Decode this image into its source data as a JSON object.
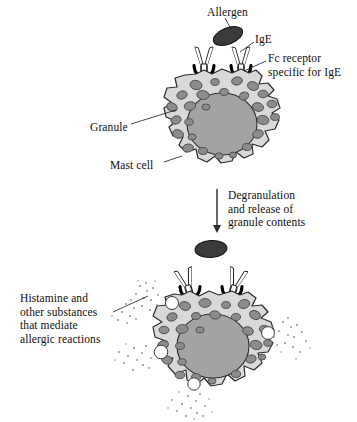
{
  "figure": {
    "background_color": "#ffffff",
    "ink_color": "#100f0f",
    "palette": {
      "cytoplasm": "#d9d9d9",
      "nucleus": "#a3a3a3",
      "granule": "#8c8c8c",
      "granule_outline": "#4a4a4a",
      "allergen": "#3b3b3b",
      "empty_granule": "#ffffff",
      "antibody_fill": "#ffffff",
      "receptor": "#000000",
      "stipple": "#9a9a9a"
    },
    "labels": {
      "allergen": "Allergen",
      "ige": "IgE",
      "fc_receptor": "Fc receptor\nspecific for IgE",
      "granule": "Granule",
      "mast_cell": "Mast cell",
      "degranulation": "Degranulation\nand release of\ngranule contents",
      "histamine": "Histamine and\nother substances\nthat mediate\nallergic reactions"
    },
    "panels": [
      {
        "name": "resting-mast-cell",
        "description": "Mast cell with IgE bound to Fc receptors; allergen approaching",
        "antibody_count": 2,
        "receptor_count": 2,
        "allergen_bound": false
      },
      {
        "name": "degranulating-mast-cell",
        "description": "Allergen cross-links two IgE molecules, triggering degranulation and release of granule contents",
        "antibody_count": 2,
        "receptor_count": 2,
        "allergen_bound": true,
        "released_granules": 4
      }
    ],
    "flow_arrow": {
      "direction": "down",
      "label_ref": "degranulation"
    }
  }
}
